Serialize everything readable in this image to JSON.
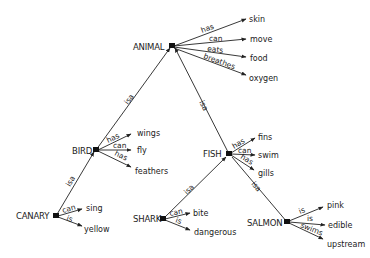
{
  "diagram": {
    "type": "semantic-network",
    "nodes": [
      {
        "id": "animal",
        "label": "ANIMAL",
        "x": 172,
        "y": 46
      },
      {
        "id": "bird",
        "label": "BIRD",
        "x": 96,
        "y": 150
      },
      {
        "id": "fish",
        "label": "FISH",
        "x": 229,
        "y": 154
      },
      {
        "id": "canary",
        "label": "CANARY",
        "x": 56,
        "y": 216
      },
      {
        "id": "shark",
        "label": "SHARK",
        "x": 163,
        "y": 219
      },
      {
        "id": "salmon",
        "label": "SALMON",
        "x": 287,
        "y": 222
      }
    ],
    "isa_edges": [
      {
        "from": "bird",
        "to": "animal",
        "label": "isa"
      },
      {
        "from": "fish",
        "to": "animal",
        "label": "isa"
      },
      {
        "from": "canary",
        "to": "bird",
        "label": "isa"
      },
      {
        "from": "shark",
        "to": "fish",
        "label": "isa"
      },
      {
        "from": "salmon",
        "to": "fish",
        "label": "isa"
      }
    ],
    "properties": {
      "animal": [
        {
          "relation": "has",
          "value": "skin"
        },
        {
          "relation": "can",
          "value": "move"
        },
        {
          "relation": "eats",
          "value": "food"
        },
        {
          "relation": "breathes",
          "value": "oxygen"
        }
      ],
      "bird": [
        {
          "relation": "has",
          "value": "wings"
        },
        {
          "relation": "can",
          "value": "fly"
        },
        {
          "relation": "has",
          "value": "feathers"
        }
      ],
      "fish": [
        {
          "relation": "has",
          "value": "fins"
        },
        {
          "relation": "can",
          "value": "swim"
        },
        {
          "relation": "has",
          "value": "gills"
        }
      ],
      "canary": [
        {
          "relation": "can",
          "value": "sing"
        },
        {
          "relation": "is",
          "value": "yellow"
        }
      ],
      "shark": [
        {
          "relation": "can",
          "value": "bite"
        },
        {
          "relation": "is",
          "value": "dangerous"
        }
      ],
      "salmon": [
        {
          "relation": "is",
          "value": "pink"
        },
        {
          "relation": "is",
          "value": "edible"
        },
        {
          "relation": "swims",
          "value": "upstream"
        }
      ]
    }
  }
}
